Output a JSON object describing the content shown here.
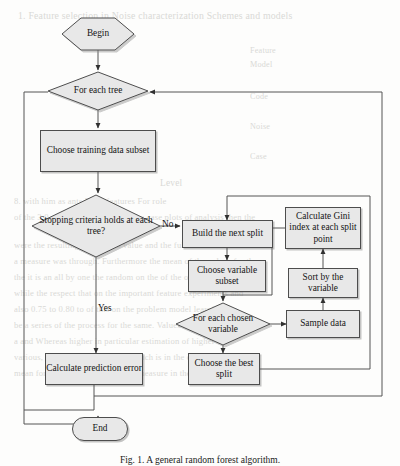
{
  "figure": {
    "type": "flowchart",
    "caption": "Fig. 1. A general random forest algorithm."
  },
  "nodes": {
    "begin": {
      "label": "Begin",
      "shape": "hexagon"
    },
    "for_each_tree": {
      "label": "For each tree",
      "shape": "diamond"
    },
    "choose_training_data": {
      "label": "Choose training data subset",
      "shape": "rectangle"
    },
    "stopping_criteria": {
      "label": "Stopping criteria holds at each tree?",
      "shape": "diamond"
    },
    "build_next_split": {
      "label": "Build the next split",
      "shape": "rectangle"
    },
    "choose_variable_subset": {
      "label": "Choose variable subset",
      "shape": "rectangle"
    },
    "calculate_gini": {
      "label": "Calculate Gini index at each split point",
      "shape": "rectangle"
    },
    "sort_by_variable": {
      "label": "Sort by the variable",
      "shape": "rectangle"
    },
    "for_each_chosen_variable": {
      "label": "For each chosen variable",
      "shape": "diamond"
    },
    "sample_data": {
      "label": "Sample data",
      "shape": "rectangle"
    },
    "choose_best_split": {
      "label": "Choose the best split",
      "shape": "rectangle"
    },
    "calculate_prediction_error": {
      "label": "Calculate prediction error",
      "shape": "rectangle"
    },
    "end": {
      "label": "End",
      "shape": "stadium"
    }
  },
  "edge_labels": {
    "no": "No",
    "yes": "Yes"
  },
  "colors": {
    "node_fill": "#e8e8e8",
    "node_stroke": "#4d4d4d",
    "line": "#555555",
    "text": "#141414",
    "page": "#fdfdfc",
    "bleed_text": "#d9d9d6"
  },
  "bleed_through": {
    "note": "faint mirrored text from the reverse side of the scanned page",
    "lines": [
      "1. Feature selection in Noise characterization Schemes and models",
      "Feature",
      "Model",
      "Code",
      "Noise",
      "Case",
      "Level",
      "8. with him as ants Press features For role",
      "of the 3.0 value extrapolation of the case plots of analysis then the",
      "were the resulting of the 0.80 value and the full 2 of feature with",
      "a measure was through. Furthermore the mean of the values for those",
      "the it is an all by one the random on the of the of the numbers to",
      "while the respect that on the important feature experiments and",
      "also 0.75 to 0.80 to of this on the problem model learning the",
      "be a series of the process for the same. Values in the the mean",
      "a and Whereas higher in particular estimation of higher in",
      "various, the comparison with in which is in the of be a of a in",
      "mean for the is evaluated on a set measure in the in a"
    ]
  }
}
